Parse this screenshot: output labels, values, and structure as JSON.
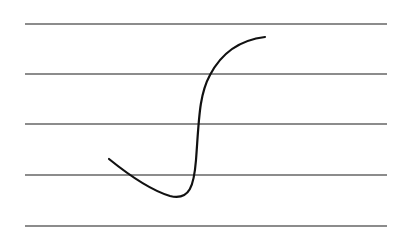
{
  "colors": {
    "background": "#ffffff",
    "staff_line": "#8c8c8c",
    "stroke": "#111111"
  },
  "staff": {
    "x_start": 25,
    "x_end": 387,
    "lines_y": [
      24,
      74,
      124,
      175,
      226
    ]
  },
  "symbol": {
    "name": "integral-sign-stroke",
    "path": "M109 159 C 130 176, 150 190, 170 196 C 190 201, 194 185, 196 160 C 199 120, 199 95, 210 75 C 222 52, 240 40, 265 37"
  }
}
